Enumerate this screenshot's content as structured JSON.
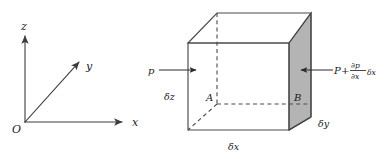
{
  "figure": {
    "background_color": "#ffffff",
    "line_color": "#4a4a4a",
    "shade_color": "#b4b4b4",
    "text_color": "#1a1a1a"
  },
  "axes": {
    "name": "cartesian-axes",
    "origin_label": "O",
    "x_label": "x",
    "y_label": "y",
    "z_label": "z"
  },
  "cube": {
    "name": "fluid-element-cube",
    "front_face_label": "A",
    "back_face_label": "B",
    "width_label": "δx",
    "depth_label": "δy",
    "height_label": "δz"
  },
  "forces": {
    "left_pressure_label": "p",
    "right_pressure": {
      "base": "P",
      "plus": "+",
      "numerator": "∂p",
      "denominator": "∂x",
      "factor": "δx"
    }
  }
}
